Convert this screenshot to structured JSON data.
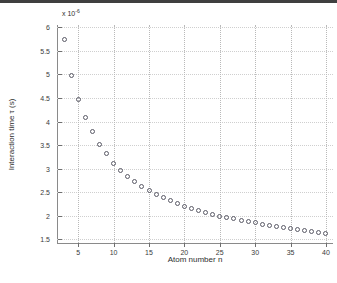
{
  "figure": {
    "background": "#ffffff",
    "marker_color": "#5a5a66",
    "grid_color": "#b9b9b9",
    "axis_color": "#8a8a8a",
    "exponent_prefix": "x 10",
    "exponent_power": "-6"
  },
  "chart_data": {
    "type": "scatter",
    "title": "",
    "xlabel": "Atom number n",
    "ylabel": "Interaction time  τ (s)",
    "y_exponent": -6,
    "y_exponent_text": "x 10^-6",
    "xlim": [
      2,
      41
    ],
    "ylim": [
      1.42,
      6.05
    ],
    "xticks": [
      5,
      10,
      15,
      20,
      25,
      30,
      35,
      40
    ],
    "xtick_labels": [
      "5",
      "10",
      "15",
      "20",
      "25",
      "30",
      "35",
      "40"
    ],
    "yticks": [
      1.5,
      2,
      2.5,
      3,
      3.5,
      4,
      4.5,
      5,
      5.5,
      6
    ],
    "ytick_labels": [
      "1.5",
      "2",
      "2.5",
      "3",
      "3.5",
      "4",
      "4.5",
      "5",
      "5.5",
      "6"
    ],
    "grid": true,
    "grid_style": "dotted",
    "legend": null,
    "marker": "circle-open",
    "x": [
      3,
      4,
      5,
      6,
      7,
      8,
      9,
      10,
      11,
      12,
      13,
      14,
      15,
      16,
      17,
      18,
      19,
      20,
      21,
      22,
      23,
      24,
      25,
      26,
      27,
      28,
      29,
      30,
      31,
      32,
      33,
      34,
      35,
      36,
      37,
      38,
      39,
      40
    ],
    "y": [
      5.75,
      4.98,
      4.47,
      4.09,
      3.78,
      3.52,
      3.32,
      3.11,
      2.96,
      2.83,
      2.72,
      2.62,
      2.53,
      2.45,
      2.38,
      2.32,
      2.26,
      2.2,
      2.15,
      2.11,
      2.07,
      2.03,
      1.99,
      1.96,
      1.93,
      1.9,
      1.87,
      1.85,
      1.82,
      1.8,
      1.77,
      1.75,
      1.73,
      1.71,
      1.69,
      1.67,
      1.65,
      1.63
    ]
  }
}
